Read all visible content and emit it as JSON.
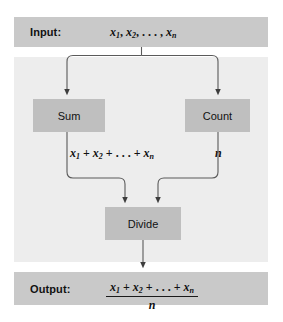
{
  "diagram": {
    "colors": {
      "band_fill": "#c9c9c9",
      "panel_fill": "#ededed",
      "box_fill": "#bfbfbf",
      "line": "#4d4d4d",
      "text": "#111111",
      "page_background": "#ffffff"
    },
    "input": {
      "label": "Input:",
      "expression": {
        "terms": [
          "x",
          "x"
        ],
        "subscripts": [
          "1",
          "2",
          "n"
        ],
        "plain": "x1, x2, . . . , xn",
        "separator": ", ",
        "ellipsis": ". . ."
      }
    },
    "output": {
      "label": "Output:",
      "fraction": {
        "numerator_plain": "x1 + x2 + . . . + xn",
        "denominator_plain": "n",
        "ellipsis": ". . ."
      }
    },
    "process_boxes": [
      {
        "id": "sum",
        "label": "Sum"
      },
      {
        "id": "count",
        "label": "Count"
      },
      {
        "id": "divide",
        "label": "Divide"
      }
    ],
    "edge_labels": {
      "sum_result_plain": "x1 + x2 + . . . + xn",
      "count_result_plain": "n"
    }
  }
}
